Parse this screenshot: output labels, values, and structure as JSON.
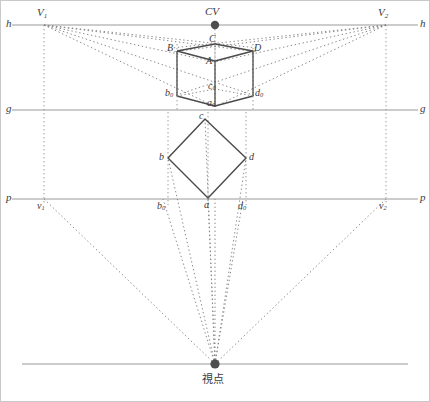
{
  "figure": {
    "title_caption": "視点",
    "type": "two-point-perspective-construction"
  },
  "axes": {
    "horizon": {
      "left_label": "h",
      "right_label": "h",
      "y": 25
    },
    "ground": {
      "left_label": "g",
      "right_label": "g",
      "y": 110
    },
    "picture": {
      "left_label": "p",
      "right_label": "p",
      "y": 199
    },
    "station": {
      "y": 364
    }
  },
  "center_of_vision": {
    "label": "CV",
    "x": 215,
    "y": 25
  },
  "vanishing_points": [
    {
      "name": "V1",
      "label": "V",
      "sub": "1",
      "x": 44,
      "y": 25
    },
    {
      "name": "V2",
      "label": "V",
      "sub": "2",
      "x": 386,
      "y": 25
    }
  ],
  "plan_vanishing_points": [
    {
      "name": "v1",
      "label": "v",
      "sub": "1",
      "x": 44,
      "y": 199
    },
    {
      "name": "v2",
      "label": "v",
      "sub": "2",
      "x": 386,
      "y": 199
    }
  ],
  "station_point": {
    "label": "視点",
    "x": 215,
    "y": 364
  },
  "perspective_cube": {
    "caption": "perspective view of cube",
    "vertices": [
      {
        "name": "B",
        "label": "B",
        "sub": "",
        "x": 177,
        "y": 51
      },
      {
        "name": "C",
        "label": "C",
        "sub": "",
        "x": 215,
        "y": 44
      },
      {
        "name": "D",
        "label": "D",
        "sub": "",
        "x": 253,
        "y": 51
      },
      {
        "name": "A",
        "label": "A",
        "sub": "",
        "x": 215,
        "y": 61
      },
      {
        "name": "b0",
        "label": "b",
        "sub": "0",
        "x": 177,
        "y": 96
      },
      {
        "name": "c0",
        "label": "c",
        "sub": "0",
        "x": 215,
        "y": 89
      },
      {
        "name": "d0",
        "label": "d",
        "sub": "0",
        "x": 253,
        "y": 96
      },
      {
        "name": "a0",
        "label": "a",
        "sub": "0",
        "x": 215,
        "y": 106
      }
    ]
  },
  "plan_square": {
    "caption": "plan view of cube (rotated square)",
    "vertices": [
      {
        "name": "c",
        "label": "c",
        "sub": "",
        "x": 205,
        "y": 119
      },
      {
        "name": "b",
        "label": "b",
        "sub": "",
        "x": 168,
        "y": 158
      },
      {
        "name": "d",
        "label": "d",
        "sub": "",
        "x": 246,
        "y": 158
      },
      {
        "name": "a",
        "label": "a",
        "sub": "",
        "x": 208,
        "y": 198
      }
    ]
  },
  "plan_projections": [
    {
      "name": "b0p",
      "label": "b",
      "sub": "0",
      "x": 163,
      "y": 199
    },
    {
      "name": "d0p",
      "label": "d",
      "sub": "0",
      "x": 243,
      "y": 199
    }
  ],
  "colors": {
    "axis_line": "#9a9a9a",
    "construction_dotted": "#8a8a8a",
    "solid_object": "#4a4a4a",
    "label_text": "#3a3a3a",
    "point_fill": "#4d4d4d",
    "background": "#ffffff",
    "border": "#b5b5b5"
  }
}
